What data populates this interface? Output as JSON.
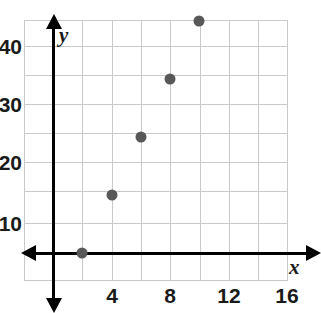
{
  "chart_data": {
    "type": "scatter",
    "title": "",
    "xlabel": "x",
    "ylabel": "y",
    "x": [
      2,
      4,
      6,
      8,
      10
    ],
    "y": [
      0,
      10,
      20,
      30,
      40
    ],
    "points": [
      {
        "x": 2,
        "y": 0
      },
      {
        "x": 4,
        "y": 10
      },
      {
        "x": 6,
        "y": 20
      },
      {
        "x": 8,
        "y": 30
      },
      {
        "x": 10,
        "y": 40
      }
    ],
    "xlim": [
      0,
      18
    ],
    "ylim": [
      -5,
      45
    ],
    "x_major_ticks": [
      4,
      8,
      12,
      16
    ],
    "x_tick_labels": [
      "4",
      "8",
      "12",
      "16"
    ],
    "y_major_ticks": [
      10,
      20,
      30,
      40
    ],
    "y_tick_labels": [
      "10",
      "20",
      "30",
      "40"
    ],
    "x_grid_step": 2,
    "y_grid_step": 5,
    "grid": true,
    "legend": null,
    "series": [
      {
        "name": "",
        "values": [
          0,
          10,
          20,
          30,
          40
        ]
      }
    ],
    "point_color": "#585858",
    "grid_color": "#c9c9c9",
    "axis_color": "#000000"
  },
  "axes": {
    "x_name": "x",
    "y_name": "y"
  }
}
